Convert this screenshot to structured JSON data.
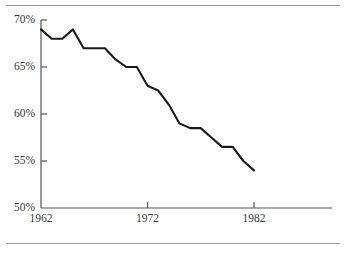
{
  "figure": {
    "title": "",
    "has_top_rule": true,
    "has_bottom_rule": true,
    "rule_color": "#9a9a9a",
    "line_color": "#1a1a1a",
    "axis_color": "#555555",
    "text_color": "#3a3a3a",
    "background": "#ffffff"
  },
  "axes": {
    "y_ticks": [
      {
        "value": 70,
        "label": "70%"
      },
      {
        "value": 65,
        "label": "65%"
      },
      {
        "value": 60,
        "label": "60%"
      },
      {
        "value": 55,
        "label": "55%"
      },
      {
        "value": 50,
        "label": "50%"
      }
    ],
    "x_ticks": [
      {
        "value": 1962,
        "label": "1962"
      },
      {
        "value": 1972,
        "label": "1972"
      },
      {
        "value": 1982,
        "label": "1982"
      }
    ]
  },
  "chart_data": {
    "type": "line",
    "title": "",
    "xlabel": "",
    "ylabel": "",
    "xlim": [
      1962,
      1984.5
    ],
    "ylim": [
      50,
      70
    ],
    "grid": false,
    "legend": null,
    "x": [
      1962,
      1963,
      1964,
      1965,
      1966,
      1967,
      1968,
      1969,
      1970,
      1971,
      1972,
      1973,
      1974,
      1975,
      1976,
      1977,
      1978,
      1979,
      1980,
      1981,
      1982
    ],
    "series": [
      {
        "name": "value",
        "values": [
          69.0,
          68.0,
          68.0,
          69.0,
          67.0,
          67.0,
          67.0,
          65.8,
          65.0,
          65.0,
          63.0,
          62.5,
          61.0,
          59.0,
          58.5,
          58.5,
          57.5,
          56.5,
          56.5,
          55.0,
          54.0
        ]
      }
    ]
  }
}
